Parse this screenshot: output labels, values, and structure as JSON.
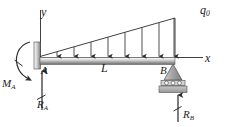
{
  "figure": {
    "labels": {
      "axis_y": "y",
      "axis_x": "x",
      "load_peak": "q",
      "load_peak_sub": "0",
      "point_a": "A",
      "point_b": "B",
      "span": "L",
      "moment_a": "M",
      "moment_a_sub": "A",
      "reaction_a": "R",
      "reaction_a_sub": "A",
      "reaction_b": "R",
      "reaction_b_sub": "B"
    },
    "icons": {
      "fixed_wall": "fixed-support-icon",
      "roller_support": "roller-support-icon",
      "moment_arc": "moment-arrow-icon",
      "load_arrow": "distributed-load-arrow-icon",
      "reaction_arrow": "reaction-force-arrow-icon",
      "axis_arrow": "axis-line-icon"
    },
    "colors": {
      "line": "#2b2b2b",
      "beam_light": "#f2f2f2",
      "beam_mid": "#b8b8b8",
      "beam_dark": "#6e6e6e",
      "wall_light": "#fbfbfb",
      "wall_dark": "#8a8a8a",
      "support_fill": "#9a9a9a",
      "ground_fill": "#a8a8a8",
      "text": "#1c1c1c"
    },
    "geometry": {
      "beam_left_x": 40,
      "beam_right_x": 175,
      "beam_top_y": 57,
      "beam_bottom_y": 64,
      "load_arrow_count": 8,
      "load_peak_top_y": 18,
      "axis_x_end": 203,
      "axis_y_top": 10
    }
  }
}
